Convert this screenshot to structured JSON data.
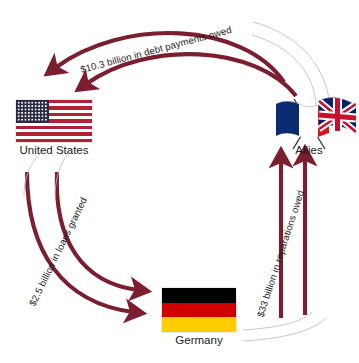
{
  "diagram": {
    "background_color": "#ffffff",
    "arrow_color": "#7b1e30",
    "arrow_tail_color": "#b9b9b9",
    "text_color": "#1c1c1c"
  },
  "nodes": [
    {
      "id": "united-states",
      "label": "United States",
      "flag": "us-flag",
      "flag_colors": [
        "#b22234",
        "#ffffff",
        "#2a2a48"
      ]
    },
    {
      "id": "allies",
      "label": "Allies",
      "flag": "france-uk-crossed-flags",
      "flag_colors": [
        "#0a2a72",
        "#ffffff",
        "#d7141a",
        "#c8102e",
        "#012169"
      ]
    },
    {
      "id": "germany",
      "label": "Germany",
      "flag": "germany-flag",
      "flag_colors": [
        "#000000",
        "#d00000",
        "#ffce00"
      ]
    }
  ],
  "flows": [
    {
      "id": "allies-to-us",
      "label": "$10.3 billion in debt payments owed",
      "amount": "$10.3 billion",
      "kind": "debt payments owed",
      "from": "allies",
      "to": "united-states"
    },
    {
      "id": "us-to-germany",
      "label": "$2.5 billion in loans granted",
      "amount": "$2.5 billion",
      "kind": "loans granted",
      "from": "united-states",
      "to": "germany"
    },
    {
      "id": "germany-to-allies",
      "label": "$33 billion in reparations owed",
      "amount": "$33 billion",
      "kind": "reparations owed",
      "from": "germany",
      "to": "allies"
    }
  ]
}
